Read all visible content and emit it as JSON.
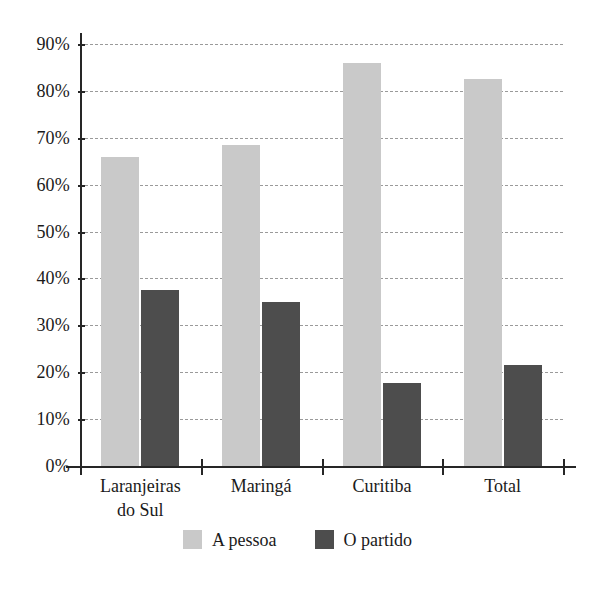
{
  "chart_data": {
    "type": "bar",
    "title": "",
    "subtitle": "",
    "xlabel": "",
    "ylabel": "",
    "categories": [
      "Laranjeiras\ndo Sul",
      "Maringá",
      "Curitiba",
      "Total"
    ],
    "series": [
      {
        "name": "A pessoa",
        "color": "#c9c9c9",
        "values": [
          66,
          68.5,
          86,
          82.5
        ]
      },
      {
        "name": "O partido",
        "color": "#4d4d4d",
        "values": [
          37.5,
          35,
          17.8,
          21.5
        ]
      }
    ],
    "ylim": [
      0,
      90
    ],
    "ytick_values": [
      0,
      10,
      20,
      30,
      40,
      50,
      60,
      70,
      80,
      90
    ],
    "ytick_labels": [
      "0%",
      "10%",
      "20%",
      "30%",
      "40%",
      "50%",
      "60%",
      "70%",
      "80%",
      "90%"
    ],
    "grid": "horizontal-dashed",
    "legend_position": "bottom-center",
    "axis_color": "#262626",
    "gridline_color": "#9a9a9a",
    "background": "#ffffff"
  },
  "legend": {
    "items": [
      {
        "label": "A pessoa",
        "swatch": "legend-swatch-light"
      },
      {
        "label": "O partido",
        "swatch": "legend-swatch-dark"
      }
    ]
  },
  "axes": {
    "y_ticks": [
      {
        "label": "90%",
        "value": 90
      },
      {
        "label": "80%",
        "value": 80
      },
      {
        "label": "70%",
        "value": 70
      },
      {
        "label": "60%",
        "value": 60
      },
      {
        "label": "50%",
        "value": 50
      },
      {
        "label": "40%",
        "value": 40
      },
      {
        "label": "30%",
        "value": 30
      },
      {
        "label": "20%",
        "value": 20
      },
      {
        "label": "10%",
        "value": 10
      },
      {
        "label": "0%",
        "value": 0
      }
    ],
    "x_categories": [
      {
        "label": "Laranjeiras\ndo Sul"
      },
      {
        "label": "Maringá"
      },
      {
        "label": "Curitiba"
      },
      {
        "label": "Total"
      }
    ]
  }
}
